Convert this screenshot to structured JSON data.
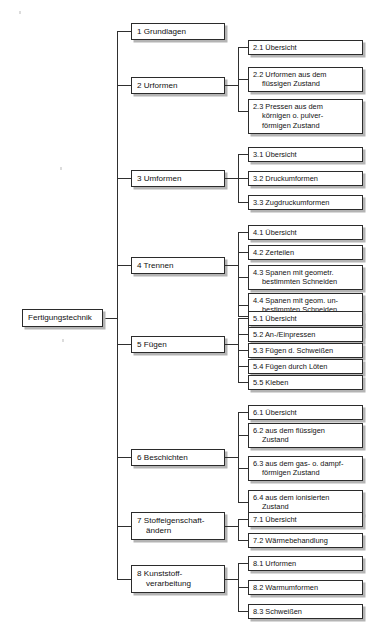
{
  "diagram": {
    "type": "tree",
    "title_visible": false,
    "root": {
      "label": "Fertigungstechnik"
    },
    "colors": {
      "box_border": "#2b2b2b",
      "box_fill": "#ffffff",
      "shadow": "#b4b4b4",
      "line": "#2f2f2f",
      "text": "#111111",
      "background": "#ffffff"
    },
    "level1": [
      {
        "label": "1 Grundlagen"
      },
      {
        "label": "2 Urformen"
      },
      {
        "label": "3 Umformen"
      },
      {
        "label": "4 Trennen"
      },
      {
        "label": "5 Fügen"
      },
      {
        "label": "6 Beschichten"
      },
      {
        "label": "7 Stoffeigenschaft-",
        "label2": "ändern"
      },
      {
        "label": "8 Kunststoff-",
        "label2": "verarbeitung"
      }
    ],
    "level2": {
      "g2": [
        {
          "label": "2.1 Übersicht"
        },
        {
          "label": "2.2 Urformen aus dem",
          "label2": "flüssigen Zustand"
        },
        {
          "label": "2.3 Pressen aus dem",
          "label2": "körnigen o. pulver-",
          "label3": "förmigen Zustand"
        }
      ],
      "g3": [
        {
          "label": "3.1 Übersicht"
        },
        {
          "label": "3.2 Druckumformen"
        },
        {
          "label": "3.3 Zugdruckumformen"
        }
      ],
      "g4": [
        {
          "label": "4.1 Übersicht"
        },
        {
          "label": "4.2 Zerteilen"
        },
        {
          "label": "4.3 Spanen mit geometr.",
          "label2": "bestimmten Schneiden"
        },
        {
          "label": "4.4 Spanen mit geom. un-",
          "label2": "bestimmten Schneiden"
        },
        {
          "label": "4.5 Abtragen"
        }
      ],
      "g5": [
        {
          "label": "5.1 Übersicht"
        },
        {
          "label": "5.2 An-/Einpressen"
        },
        {
          "label": "5.3 Fügen d. Schweißen"
        },
        {
          "label": "5.4 Fügen durch Löten"
        },
        {
          "label": "5.5 Kleben"
        }
      ],
      "g6": [
        {
          "label": "6.1 Übersicht"
        },
        {
          "label": "6.2 aus dem flüssigen",
          "label2": "Zustand"
        },
        {
          "label": "6.3 aus dem gas- o. dampf-",
          "label2": "förmigen Zustand"
        },
        {
          "label": "6.4 aus dem ionisierten",
          "label2": "Zustand"
        }
      ],
      "g7": [
        {
          "label": "7.1 Übersicht"
        },
        {
          "label": "7.2 Wärmebehandlung"
        }
      ],
      "g8": [
        {
          "label": "8.1 Urformen"
        },
        {
          "label": "8.2 Warmumformen"
        },
        {
          "label": "8.3 Schweißen"
        }
      ]
    }
  }
}
